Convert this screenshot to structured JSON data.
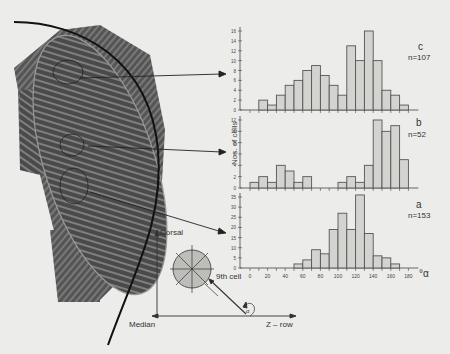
{
  "figure": {
    "ylabel": "Nos. of cells",
    "xlabel_suffix": "°α",
    "diagram": {
      "dorsal_label": "Dorsal",
      "median_label": "Median",
      "z_row_label": "Z – row",
      "cell_label": "9th cell",
      "angle_symbol": "α"
    }
  },
  "chart_data": [
    {
      "type": "bar",
      "panel": "c",
      "n_label": "n=107",
      "title": "c",
      "xlabel": "°α",
      "ylabel": "Nos. of cells",
      "bin_width": 10,
      "categories": [
        "0-10",
        "10-20",
        "20-30",
        "30-40",
        "40-50",
        "50-60",
        "60-70",
        "70-80",
        "80-90",
        "90-100",
        "100-110",
        "110-120",
        "120-130",
        "130-140",
        "140-150",
        "150-160",
        "160-170",
        "170-180"
      ],
      "values": [
        0,
        2,
        1,
        3,
        5,
        6,
        8,
        9,
        7,
        5,
        3,
        13,
        10,
        16,
        10,
        4,
        3,
        1
      ],
      "ylim": [
        0,
        16
      ],
      "yticks": [
        0,
        2,
        4,
        6,
        8,
        10,
        12,
        14,
        16
      ],
      "xlim": [
        0,
        180
      ]
    },
    {
      "type": "bar",
      "panel": "b",
      "n_label": "n=52",
      "title": "b",
      "xlabel": "°α",
      "ylabel": "Nos. of cells",
      "bin_width": 10,
      "categories": [
        "0-10",
        "10-20",
        "20-30",
        "30-40",
        "40-50",
        "50-60",
        "60-70",
        "70-80",
        "80-90",
        "90-100",
        "100-110",
        "110-120",
        "120-130",
        "130-140",
        "140-150",
        "150-160",
        "160-170",
        "170-180"
      ],
      "values": [
        1,
        2,
        1,
        4,
        3,
        1,
        2,
        0,
        0,
        0,
        1,
        2,
        1,
        4,
        12,
        10,
        11,
        5
      ],
      "ylim": [
        0,
        12
      ],
      "yticks": [
        0,
        2,
        4,
        6,
        8,
        10,
        12
      ],
      "xlim": [
        0,
        180
      ]
    },
    {
      "type": "bar",
      "panel": "a",
      "n_label": "n=153",
      "title": "a",
      "xlabel": "°α",
      "ylabel": "Nos. of cells",
      "bin_width": 10,
      "categories": [
        "0-10",
        "10-20",
        "20-30",
        "30-40",
        "40-50",
        "50-60",
        "60-70",
        "70-80",
        "80-90",
        "90-100",
        "100-110",
        "110-120",
        "120-130",
        "130-140",
        "140-150",
        "150-160",
        "160-170",
        "170-180"
      ],
      "values": [
        0,
        0,
        0,
        0,
        0,
        2,
        4,
        9,
        7,
        19,
        27,
        19,
        36,
        17,
        6,
        5,
        2,
        0
      ],
      "ylim": [
        0,
        35
      ],
      "yticks": [
        0,
        5,
        10,
        15,
        20,
        25,
        30,
        35
      ],
      "xticks": [
        0,
        20,
        40,
        60,
        80,
        100,
        120,
        140,
        160,
        180
      ],
      "xlim": [
        0,
        180
      ]
    }
  ]
}
